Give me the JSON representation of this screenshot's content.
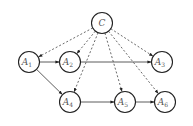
{
  "diagram": {
    "type": "directed-graph",
    "node_radius": 10.5,
    "nodes": [
      {
        "id": "C",
        "label": "C",
        "sub": "",
        "x": 102,
        "y": 23
      },
      {
        "id": "A1",
        "label": "A",
        "sub": "1",
        "x": 29,
        "y": 62
      },
      {
        "id": "A2",
        "label": "A",
        "sub": "2",
        "x": 70,
        "y": 62
      },
      {
        "id": "A3",
        "label": "A",
        "sub": "3",
        "x": 162,
        "y": 62
      },
      {
        "id": "A4",
        "label": "A",
        "sub": "4",
        "x": 70,
        "y": 102
      },
      {
        "id": "A5",
        "label": "A",
        "sub": "5",
        "x": 125,
        "y": 102
      },
      {
        "id": "A6",
        "label": "A",
        "sub": "6",
        "x": 165,
        "y": 102
      }
    ],
    "edges": [
      {
        "from": "C",
        "to": "A1",
        "style": "dashed"
      },
      {
        "from": "C",
        "to": "A2",
        "style": "dashed"
      },
      {
        "from": "C",
        "to": "A3",
        "style": "dashed"
      },
      {
        "from": "C",
        "to": "A4",
        "style": "dashed"
      },
      {
        "from": "C",
        "to": "A5",
        "style": "dashed"
      },
      {
        "from": "C",
        "to": "A6",
        "style": "dashed"
      },
      {
        "from": "A1",
        "to": "A2",
        "style": "solid"
      },
      {
        "from": "A2",
        "to": "A3",
        "style": "solid"
      },
      {
        "from": "A1",
        "to": "A4",
        "style": "solid"
      },
      {
        "from": "A4",
        "to": "A5",
        "style": "solid"
      },
      {
        "from": "A5",
        "to": "A6",
        "style": "solid"
      }
    ]
  }
}
